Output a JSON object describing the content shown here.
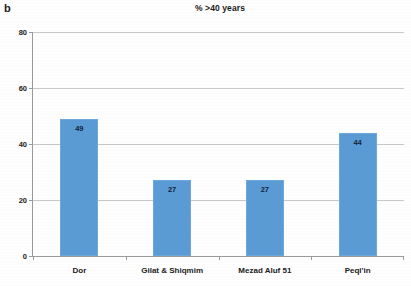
{
  "panel": {
    "label": "b"
  },
  "chart_data": {
    "type": "bar",
    "title": "% >40 years",
    "xlabel": "",
    "ylabel": "",
    "ylim": [
      0,
      80
    ],
    "yticks": [
      0,
      20,
      40,
      60,
      80
    ],
    "ytick_labels": [
      "0",
      "20",
      "40",
      "60",
      "80"
    ],
    "grid": true,
    "legend": "none",
    "bar_color": "#5b9bd5",
    "categories": [
      "Dor",
      "Gilat & Shiqmim",
      "Mezad Aluf 51",
      "Peqi'in"
    ],
    "values": [
      49,
      27,
      27,
      44
    ],
    "value_labels": [
      "49",
      "27",
      "27",
      "44"
    ]
  }
}
